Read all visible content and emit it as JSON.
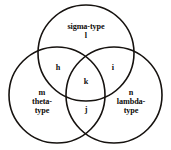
{
  "figure": {
    "type": "venn-diagram",
    "sets": 3,
    "background_color": "#ffffff",
    "stroke_color": "#16120f",
    "text_color": "#100d0b"
  },
  "circles": [
    {
      "id": "sigma",
      "set_label": "sigma-type",
      "exclusive_element": "l",
      "cx": 86,
      "cy": 53,
      "r": 48
    },
    {
      "id": "theta",
      "set_label": "theta-\ntype",
      "exclusive_element": "m",
      "cx": 57,
      "cy": 95,
      "r": 48
    },
    {
      "id": "lambda",
      "set_label": "lambda-\ntype",
      "exclusive_element": "n",
      "cx": 114,
      "cy": 95,
      "r": 48
    }
  ],
  "regions": {
    "sigma_only": "l",
    "theta_only": "m",
    "lambda_only": "n",
    "sigma_theta": "h",
    "sigma_lambda": "i",
    "theta_lambda": "j",
    "all_three": "k"
  }
}
